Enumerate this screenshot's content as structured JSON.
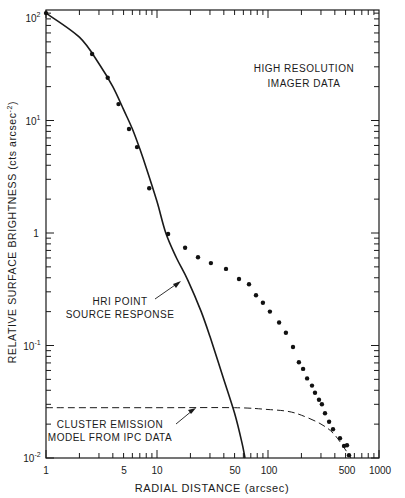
{
  "chart_data": {
    "type": "scatter",
    "title": "",
    "xlabel": "RADIAL DISTANCE (arcsec)",
    "ylabel": "RELATIVE SURFACE BRIGHTNESS (cts arcsec^-2)",
    "xscale": "log",
    "yscale": "log",
    "xlim": [
      1,
      1000
    ],
    "ylim": [
      0.01,
      100
    ],
    "x_ticks": [
      "1",
      "5",
      "10",
      "50",
      "100",
      "500",
      "1000"
    ],
    "y_ticks": [
      "10^2",
      "10^1",
      "1",
      "10^-1",
      "10^-2"
    ],
    "grid": false,
    "annotations": [
      {
        "text": "HIGH RESOLUTION IMAGER DATA",
        "position": "upper right"
      },
      {
        "text": "HRI POINT SOURCE RESPONSE",
        "arrow_to": [
          19,
          0.38
        ]
      },
      {
        "text": "CLUSTER EMISSION MODEL FROM IPC DATA",
        "arrow_to": [
          21,
          0.028
        ]
      }
    ],
    "series": [
      {
        "name": "HIGH RESOLUTION IMAGER DATA",
        "style": "points",
        "x": [
          1.0,
          2.6,
          3.6,
          4.5,
          5.6,
          6.6,
          8.5,
          12.6,
          17.9,
          23.4,
          30.6,
          41.8,
          54.8,
          67.4,
          78,
          90,
          104,
          126,
          145,
          168,
          190,
          207,
          225,
          249,
          265,
          288,
          306,
          326,
          355,
          385,
          445,
          484,
          515,
          537
        ],
        "y": [
          90,
          39,
          24,
          14,
          8.4,
          5.8,
          2.5,
          0.98,
          0.74,
          0.61,
          0.54,
          0.48,
          0.39,
          0.35,
          0.28,
          0.24,
          0.2,
          0.16,
          0.13,
          0.097,
          0.071,
          0.062,
          0.051,
          0.044,
          0.038,
          0.033,
          0.03,
          0.025,
          0.021,
          0.018,
          0.015,
          0.0128,
          0.013,
          0.0106
        ]
      },
      {
        "name": "HRI POINT SOURCE RESPONSE",
        "style": "solid line",
        "x": [
          1,
          2,
          3,
          4,
          5,
          6,
          7,
          8,
          10,
          12,
          15,
          19,
          25,
          30,
          40,
          50,
          58,
          62
        ],
        "y": [
          90,
          55,
          32,
          20,
          12.5,
          8.4,
          5.6,
          3.8,
          1.9,
          1.0,
          0.6,
          0.38,
          0.2,
          0.12,
          0.05,
          0.025,
          0.014,
          0.01
        ]
      },
      {
        "name": "CLUSTER EMISSION MODEL FROM IPC DATA",
        "style": "dashed line",
        "x": [
          1,
          10,
          50,
          100,
          150,
          200,
          300,
          400,
          560
        ],
        "y": [
          0.028,
          0.028,
          0.028,
          0.027,
          0.026,
          0.024,
          0.02,
          0.016,
          0.01
        ]
      }
    ]
  },
  "labels": {
    "hri_data_line1": "HIGH RESOLUTION",
    "hri_data_line2": "IMAGER DATA",
    "point_src_line1": "HRI POINT",
    "point_src_line2": "SOURCE RESPONSE",
    "cluster_line1": "CLUSTER EMISSION",
    "cluster_line2": "MODEL FROM IPC DATA",
    "xlabel": "RADIAL DISTANCE (arcsec)",
    "ylabel": "RELATIVE SURFACE BRIGHTNESS (cts arcsec",
    "ylabel_exp": "-2",
    "ylabel_close": ")"
  },
  "ticks": {
    "x": [
      "1",
      "5",
      "10",
      "50",
      "100",
      "500",
      "1000"
    ],
    "y_base": "10",
    "y_one": "1",
    "y_exp": [
      "2",
      "1",
      "-1",
      "-2"
    ]
  }
}
